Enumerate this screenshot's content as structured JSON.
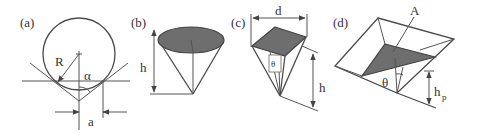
{
  "figure": {
    "colors": {
      "line": "#555555",
      "shade": "#6e6e6e",
      "background": "#ffffff"
    },
    "panels": [
      {
        "id": "a",
        "label": "(a)",
        "shape": "spherical tip",
        "symbols": {
          "radius": "R",
          "angle": "α",
          "width": "a"
        }
      },
      {
        "id": "b",
        "label": "(b)",
        "shape": "conical tip",
        "symbols": {
          "height": "h"
        }
      },
      {
        "id": "c",
        "label": "(c)",
        "shape": "four-sided pyramid tip",
        "symbols": {
          "width": "d",
          "angle": "θ",
          "height": "h"
        }
      },
      {
        "id": "d",
        "label": "(d)",
        "shape": "three-sided pyramid tip",
        "symbols": {
          "axis": "A",
          "angle": "θ",
          "height": "h",
          "height_subscript": "p"
        }
      }
    ]
  }
}
